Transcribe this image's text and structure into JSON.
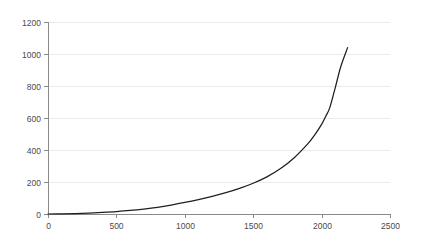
{
  "chart_data": {
    "type": "line",
    "title": "",
    "subtitle": "",
    "xlabel": "",
    "ylabel": "",
    "xlim": [
      0,
      2500
    ],
    "ylim": [
      0,
      1200
    ],
    "grid": "horizontal",
    "legend": "none",
    "x_ticks": [
      0,
      500,
      1000,
      1500,
      2000,
      2500
    ],
    "y_ticks": [
      0,
      200,
      400,
      600,
      800,
      1000,
      1200
    ],
    "x_tick_labels": [
      "0",
      "500",
      "1000",
      "1500",
      "2000",
      "2500"
    ],
    "y_tick_labels": [
      "0",
      "200",
      "400",
      "600",
      "800",
      "1000",
      "1200"
    ],
    "series": [
      {
        "name": "series-1",
        "color": "#1f1f1f",
        "x": [
          0,
          100,
          200,
          300,
          400,
          500,
          600,
          700,
          800,
          900,
          1000,
          1100,
          1200,
          1300,
          1400,
          1500,
          1600,
          1700,
          1800,
          1900,
          1950,
          2000,
          2030,
          2060,
          2100,
          2140,
          2190
        ],
        "values": [
          0,
          1,
          3,
          6,
          10,
          15,
          22,
          31,
          42,
          56,
          72,
          90,
          110,
          133,
          160,
          192,
          232,
          284,
          352,
          440,
          495,
          560,
          610,
          665,
          790,
          920,
          1040
        ]
      }
    ],
    "colors": {
      "line": "#1f1f1f",
      "grid": "#ebebeb",
      "axis": "#8a8a8a",
      "tick_text": "#4a4a4a",
      "background": "#ffffff"
    },
    "geometry": {
      "plot_left": 48,
      "plot_right": 390,
      "plot_top": 22,
      "plot_bottom": 214,
      "tick_length": 4
    }
  }
}
